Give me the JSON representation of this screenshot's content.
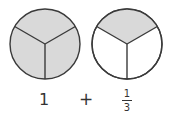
{
  "diagram": {
    "circles": [
      {
        "name": "whole-circle",
        "parts": 3,
        "shaded_parts": 3,
        "fill": "#d9d9d9",
        "empty": "#ffffff"
      },
      {
        "name": "third-circle",
        "parts": 3,
        "shaded_parts": 1,
        "fill": "#d9d9d9",
        "empty": "#ffffff"
      }
    ],
    "stroke_color": "#3a3a3a",
    "labels": {
      "whole": "1",
      "operator": "+",
      "fraction_numerator": "1",
      "fraction_denominator": "3"
    }
  }
}
